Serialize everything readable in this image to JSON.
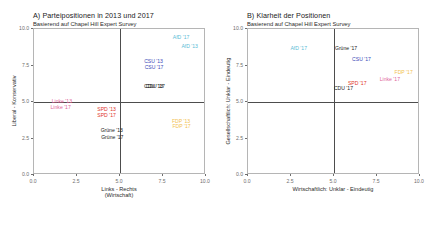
{
  "figure": {
    "width": 428,
    "height": 231,
    "background": "#ffffff"
  },
  "colors": {
    "afd": "#5bbcd6",
    "csu": "#3b4bb8",
    "cdu": "#1a1a1a",
    "linke": "#e0649b",
    "spd": "#e0352b",
    "gruene": "#1a1a1a",
    "fdp": "#f2c14e",
    "axis": "#6e6e6e",
    "frame": "#b5b5b5",
    "refline": "#4d4d4d"
  },
  "panels": [
    {
      "id": "a",
      "title": "A) Parteipositionen in 2013 und 2017",
      "subtitle": "Basierend auf Chapel Hill Expert Survey",
      "xlabel_line1": "Links - Rechts",
      "xlabel_line2": "(Wirtschaft)",
      "ylabel": "Liberal - Konservativ",
      "xticks": [
        "0.0",
        "2.5",
        "5.0",
        "7.5",
        "10.0"
      ],
      "yticks": [
        "0.0",
        "2.5",
        "5.0",
        "7.5",
        "10.0"
      ],
      "xlim": [
        0,
        10
      ],
      "ylim": [
        0,
        10
      ],
      "reflines": {
        "x": 5.0,
        "y": 5.0
      }
    },
    {
      "id": "b",
      "title": "B) Klarheit der Positionen",
      "subtitle": "Basierend auf Chapel Hill Expert Survey",
      "xlabel_line1": "Wirtschaftlich: Unklar - Eindeutig",
      "xlabel_line2": "",
      "ylabel": "Gesellschaftlich: Unklar - Eindeutig",
      "xticks": [
        "0.0",
        "2.5",
        "5.0",
        "7.5",
        "10.0"
      ],
      "yticks": [
        "0.0",
        "2.5",
        "5.0",
        "7.5",
        "10.0"
      ],
      "xlim": [
        0,
        10
      ],
      "ylim": [
        0,
        10
      ],
      "reflines": {
        "x": 5.0,
        "y": 5.0
      }
    }
  ],
  "chart_data": [
    {
      "type": "scatter",
      "panel": "A",
      "title": "A) Parteipositionen in 2013 und 2017",
      "subtitle": "Basierend auf Chapel Hill Expert Survey",
      "xlabel": "Links - Rechts (Wirtschaft)",
      "ylabel": "Liberal - Konservativ",
      "xlim": [
        0,
        10
      ],
      "ylim": [
        0,
        10
      ],
      "xticks": [
        0.0,
        2.5,
        5.0,
        7.5,
        10.0
      ],
      "yticks": [
        0.0,
        2.5,
        5.0,
        7.5,
        10.0
      ],
      "grid": false,
      "legend": "none",
      "reference_lines": {
        "vertical_x": 5.0,
        "horizontal_y": 5.0
      },
      "labels_as_markers": true,
      "points": [
        {
          "label": "AfD '17",
          "party": "AfD",
          "year": "2017",
          "x": 8.55,
          "y": 9.4,
          "color": "#5bbcd6"
        },
        {
          "label": "AfD '13",
          "party": "AfD",
          "year": "2013",
          "x": 9.05,
          "y": 8.78,
          "color": "#5bbcd6"
        },
        {
          "label": "CSU '13",
          "party": "CSU",
          "year": "2013",
          "x": 6.95,
          "y": 7.72,
          "color": "#3b4bb8"
        },
        {
          "label": "CSU '17",
          "party": "CSU",
          "year": "2017",
          "x": 6.98,
          "y": 7.33,
          "color": "#3b4bb8"
        },
        {
          "label": "CDU '13",
          "party": "CDU",
          "year": "2013",
          "x": 6.95,
          "y": 6.02,
          "color": "#1a1a1a"
        },
        {
          "label": "CDU '17",
          "party": "CDU",
          "year": "2017",
          "x": 7.05,
          "y": 6.0,
          "color": "#1a1a1a"
        },
        {
          "label": "Linke '13",
          "party": "Linke",
          "year": "2013",
          "x": 1.62,
          "y": 5.02,
          "color": "#e0649b"
        },
        {
          "label": "Linke '17",
          "party": "Linke",
          "year": "2017",
          "x": 1.55,
          "y": 4.62,
          "color": "#e0649b"
        },
        {
          "label": "SPD '13",
          "party": "SPD",
          "year": "2013",
          "x": 4.22,
          "y": 4.42,
          "color": "#e0352b"
        },
        {
          "label": "SPD '17",
          "party": "SPD",
          "year": "2017",
          "x": 4.22,
          "y": 4.05,
          "color": "#e0352b"
        },
        {
          "label": "FDP '13",
          "party": "FDP",
          "year": "2013",
          "x": 8.55,
          "y": 3.62,
          "color": "#f2c14e"
        },
        {
          "label": "FDP '17",
          "party": "FDP",
          "year": "2017",
          "x": 8.58,
          "y": 3.3,
          "color": "#f2c14e"
        },
        {
          "label": "Grüne '13",
          "party": "Grüne",
          "year": "2013",
          "x": 4.52,
          "y": 3.02,
          "color": "#1a1a1a"
        },
        {
          "label": "Grüne '17",
          "party": "Grüne",
          "year": "2017",
          "x": 4.55,
          "y": 2.55,
          "color": "#1a1a1a"
        }
      ]
    },
    {
      "type": "scatter",
      "panel": "B",
      "title": "B) Klarheit der Positionen",
      "subtitle": "Basierend auf Chapel Hill Expert Survey",
      "xlabel": "Wirtschaftlich: Unklar - Eindeutig",
      "ylabel": "Gesellschaftlich: Unklar - Eindeutig",
      "xlim": [
        0,
        10
      ],
      "ylim": [
        0,
        10
      ],
      "xticks": [
        0.0,
        2.5,
        5.0,
        7.5,
        10.0
      ],
      "yticks": [
        0.0,
        2.5,
        5.0,
        7.5,
        10.0
      ],
      "grid": false,
      "legend": "none",
      "reference_lines": {
        "vertical_x": 5.0,
        "horizontal_y": 5.0
      },
      "labels_as_markers": true,
      "points": [
        {
          "label": "AfD '17",
          "party": "AfD",
          "year": "2017",
          "x": 2.95,
          "y": 8.6,
          "color": "#5bbcd6"
        },
        {
          "label": "Grüne '17",
          "party": "Grüne",
          "year": "2017",
          "x": 5.7,
          "y": 8.6,
          "color": "#1a1a1a"
        },
        {
          "label": "CSU '17",
          "party": "CSU",
          "year": "2017",
          "x": 6.6,
          "y": 7.85,
          "color": "#3b4bb8"
        },
        {
          "label": "FDP '17",
          "party": "FDP",
          "year": "2017",
          "x": 9.05,
          "y": 7.0,
          "color": "#f2c14e"
        },
        {
          "label": "Linke '17",
          "party": "Linke",
          "year": "2017",
          "x": 8.25,
          "y": 6.48,
          "color": "#e0649b"
        },
        {
          "label": "SPD '17",
          "party": "SPD",
          "year": "2017",
          "x": 6.35,
          "y": 6.25,
          "color": "#e0352b"
        },
        {
          "label": "CDU '17",
          "party": "CDU",
          "year": "2017",
          "x": 5.55,
          "y": 5.88,
          "color": "#1a1a1a"
        }
      ]
    }
  ]
}
